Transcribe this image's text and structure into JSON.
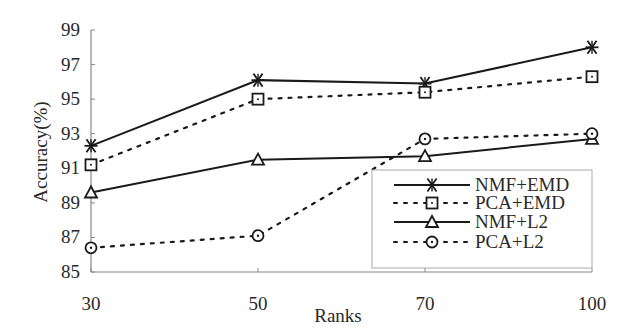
{
  "chart_data": {
    "type": "line",
    "title": "",
    "xlabel": "Ranks",
    "ylabel": "Accuracy(%)",
    "categories": [
      "30",
      "50",
      "70",
      "100"
    ],
    "y_ticks": [
      "99",
      "97",
      "95",
      "93",
      "91",
      "89",
      "87",
      "85"
    ],
    "ylim": [
      85,
      99
    ],
    "grid": false,
    "legend_position": "lower right",
    "series": [
      {
        "name": "NMF+EMD",
        "style": "solid",
        "marker": "asterisk",
        "values": [
          92.3,
          96.1,
          95.9,
          98.0
        ]
      },
      {
        "name": "PCA+EMD",
        "style": "dotted",
        "marker": "square",
        "values": [
          91.2,
          95.0,
          95.4,
          96.3
        ]
      },
      {
        "name": "NMF+L2",
        "style": "solid",
        "marker": "triangle",
        "values": [
          89.6,
          91.5,
          91.7,
          92.7
        ]
      },
      {
        "name": "PCA+L2",
        "style": "dotted",
        "marker": "circle",
        "values": [
          86.4,
          87.1,
          92.7,
          93.0
        ]
      }
    ]
  },
  "colors": {
    "line": "#1a1a1a",
    "axis": "#888888"
  }
}
